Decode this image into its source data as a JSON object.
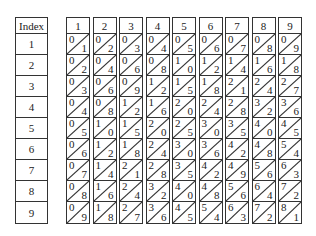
{
  "index": {
    "header": "Index",
    "rows": [
      "1",
      "2",
      "3",
      "4",
      "5",
      "6",
      "7",
      "8",
      "9"
    ]
  },
  "bones": [
    {
      "header": "1",
      "cells": [
        [
          "0",
          "1"
        ],
        [
          "0",
          "2"
        ],
        [
          "0",
          "3"
        ],
        [
          "0",
          "4"
        ],
        [
          "0",
          "5"
        ],
        [
          "0",
          "6"
        ],
        [
          "0",
          "7"
        ],
        [
          "0",
          "8"
        ],
        [
          "0",
          "9"
        ]
      ]
    },
    {
      "header": "2",
      "cells": [
        [
          "0",
          "2"
        ],
        [
          "0",
          "4"
        ],
        [
          "0",
          "6"
        ],
        [
          "0",
          "8"
        ],
        [
          "1",
          "0"
        ],
        [
          "1",
          "2"
        ],
        [
          "1",
          "4"
        ],
        [
          "1",
          "6"
        ],
        [
          "1",
          "8"
        ]
      ]
    },
    {
      "header": "3",
      "cells": [
        [
          "0",
          "3"
        ],
        [
          "0",
          "6"
        ],
        [
          "0",
          "9"
        ],
        [
          "1",
          "2"
        ],
        [
          "1",
          "5"
        ],
        [
          "1",
          "8"
        ],
        [
          "2",
          "1"
        ],
        [
          "2",
          "4"
        ],
        [
          "2",
          "7"
        ]
      ]
    },
    {
      "header": "4",
      "cells": [
        [
          "0",
          "4"
        ],
        [
          "0",
          "8"
        ],
        [
          "1",
          "2"
        ],
        [
          "1",
          "6"
        ],
        [
          "2",
          "0"
        ],
        [
          "2",
          "4"
        ],
        [
          "2",
          "8"
        ],
        [
          "3",
          "2"
        ],
        [
          "3",
          "6"
        ]
      ]
    },
    {
      "header": "5",
      "cells": [
        [
          "0",
          "5"
        ],
        [
          "1",
          "0"
        ],
        [
          "1",
          "5"
        ],
        [
          "2",
          "0"
        ],
        [
          "2",
          "5"
        ],
        [
          "3",
          "0"
        ],
        [
          "3",
          "5"
        ],
        [
          "4",
          "0"
        ],
        [
          "4",
          "5"
        ]
      ]
    },
    {
      "header": "6",
      "cells": [
        [
          "0",
          "6"
        ],
        [
          "1",
          "2"
        ],
        [
          "1",
          "8"
        ],
        [
          "2",
          "4"
        ],
        [
          "3",
          "0"
        ],
        [
          "3",
          "6"
        ],
        [
          "4",
          "2"
        ],
        [
          "4",
          "8"
        ],
        [
          "5",
          "4"
        ]
      ]
    },
    {
      "header": "7",
      "cells": [
        [
          "0",
          "7"
        ],
        [
          "1",
          "4"
        ],
        [
          "2",
          "1"
        ],
        [
          "2",
          "8"
        ],
        [
          "3",
          "5"
        ],
        [
          "4",
          "2"
        ],
        [
          "4",
          "9"
        ],
        [
          "5",
          "6"
        ],
        [
          "6",
          "3"
        ]
      ]
    },
    {
      "header": "8",
      "cells": [
        [
          "0",
          "8"
        ],
        [
          "1",
          "6"
        ],
        [
          "2",
          "4"
        ],
        [
          "3",
          "2"
        ],
        [
          "4",
          "0"
        ],
        [
          "4",
          "8"
        ],
        [
          "5",
          "6"
        ],
        [
          "6",
          "4"
        ],
        [
          "7",
          "2"
        ]
      ]
    },
    {
      "header": "9",
      "cells": [
        [
          "0",
          "9"
        ],
        [
          "1",
          "8"
        ],
        [
          "2",
          "7"
        ],
        [
          "3",
          "6"
        ],
        [
          "4",
          "5"
        ],
        [
          "5",
          "4"
        ],
        [
          "6",
          "3"
        ],
        [
          "7",
          "2"
        ],
        [
          "8",
          "1"
        ]
      ]
    }
  ]
}
